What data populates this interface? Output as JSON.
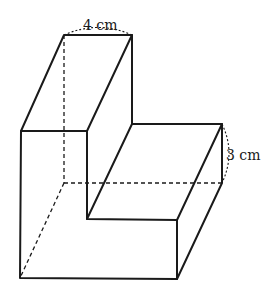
{
  "figure": {
    "labels": {
      "top_width": "4 cm",
      "step_height": "3 cm"
    },
    "colors": {
      "line": "#1a1a1a",
      "background": "#ffffff"
    }
  }
}
